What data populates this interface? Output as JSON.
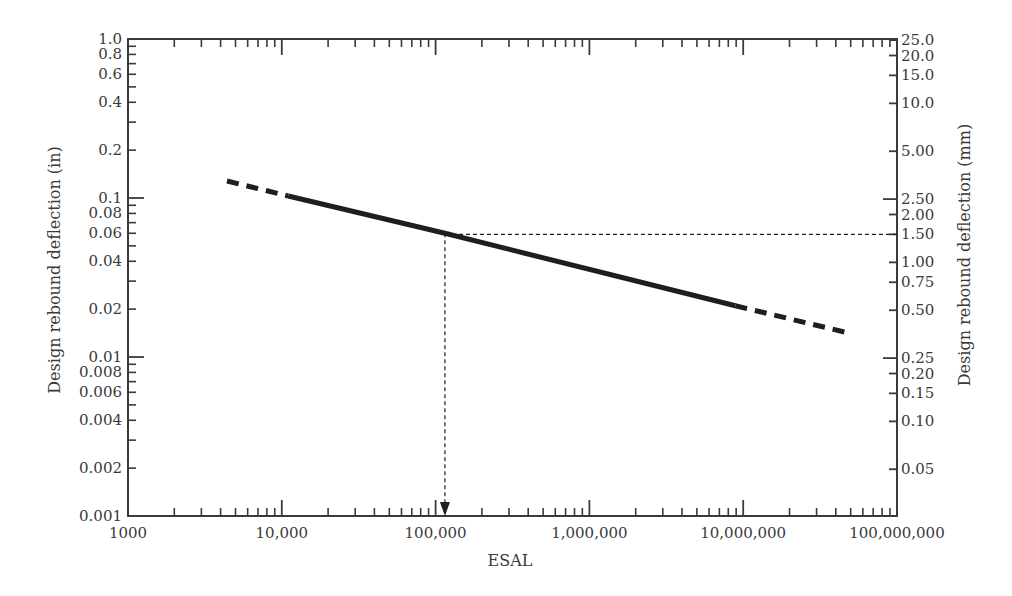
{
  "chart_data": {
    "type": "line",
    "title": "",
    "xlabel": "ESAL",
    "ylabel": "Design rebound deflection (in)",
    "ylabel_right": "Design rebound deflection (mm)",
    "xscale": "log",
    "yscale": "log",
    "xlim": [
      1000,
      100000000
    ],
    "ylim": [
      0.001,
      1.0
    ],
    "grid": false,
    "legend": null,
    "x_ticks": [
      {
        "value": 1000,
        "label": "1000"
      },
      {
        "value": 10000,
        "label": "10,000"
      },
      {
        "value": 100000,
        "label": "100,000"
      },
      {
        "value": 1000000,
        "label": "1,000,000"
      },
      {
        "value": 10000000,
        "label": "10,000,000"
      },
      {
        "value": 100000000,
        "label": "100,000,000"
      }
    ],
    "y_ticks_left": [
      {
        "value": 1.0,
        "label": "1.0"
      },
      {
        "value": 0.8,
        "label": "0.8"
      },
      {
        "value": 0.6,
        "label": "0.6"
      },
      {
        "value": 0.4,
        "label": "0.4"
      },
      {
        "value": 0.2,
        "label": "0.2"
      },
      {
        "value": 0.1,
        "label": "0.1"
      },
      {
        "value": 0.08,
        "label": "0.08"
      },
      {
        "value": 0.06,
        "label": "0.06"
      },
      {
        "value": 0.04,
        "label": "0.04"
      },
      {
        "value": 0.02,
        "label": "0.02"
      },
      {
        "value": 0.01,
        "label": "0.01"
      },
      {
        "value": 0.008,
        "label": "0.008"
      },
      {
        "value": 0.006,
        "label": "0.006"
      },
      {
        "value": 0.004,
        "label": "0.004"
      },
      {
        "value": 0.002,
        "label": "0.002"
      },
      {
        "value": 0.001,
        "label": "0.001"
      }
    ],
    "y_ticks_right": [
      {
        "value_mm": 25.0,
        "label": "25.0"
      },
      {
        "value_mm": 20.0,
        "label": "20.0"
      },
      {
        "value_mm": 15.0,
        "label": "15.0"
      },
      {
        "value_mm": 10.0,
        "label": "10.0"
      },
      {
        "value_mm": 5.0,
        "label": "5.00"
      },
      {
        "value_mm": 2.5,
        "label": "2.50"
      },
      {
        "value_mm": 2.0,
        "label": "2.00"
      },
      {
        "value_mm": 1.5,
        "label": "1.50"
      },
      {
        "value_mm": 1.0,
        "label": "1.00"
      },
      {
        "value_mm": 0.75,
        "label": "0.75"
      },
      {
        "value_mm": 0.5,
        "label": "0.50"
      },
      {
        "value_mm": 0.25,
        "label": "0.25"
      },
      {
        "value_mm": 0.2,
        "label": "0.20"
      },
      {
        "value_mm": 0.15,
        "label": "0.15"
      },
      {
        "value_mm": 0.1,
        "label": "0.10"
      },
      {
        "value_mm": 0.05,
        "label": "0.05"
      }
    ],
    "series": [
      {
        "name": "Design rebound deflection vs ESAL (extrapolated, low)",
        "style": "dashed",
        "x": [
          4400,
          11000
        ],
        "y": [
          0.128,
          0.103
        ]
      },
      {
        "name": "Design rebound deflection vs ESAL",
        "style": "solid",
        "x": [
          11000,
          115000,
          8900000
        ],
        "y": [
          0.103,
          0.06,
          0.021
        ]
      },
      {
        "name": "Design rebound deflection vs ESAL (extrapolated, high)",
        "style": "dashed",
        "x": [
          8900000,
          51000000
        ],
        "y": [
          0.021,
          0.014
        ]
      }
    ],
    "annotations": [
      {
        "type": "guide-line-horizontal",
        "style": "dotted",
        "y": 0.059,
        "y_mm": 1.5,
        "x_from": 115000,
        "x_to": 100000000
      },
      {
        "type": "guide-arrow-vertical",
        "style": "dotted",
        "x": 115000,
        "y_from": 0.06,
        "y_to": 0.001
      }
    ]
  },
  "colors": {
    "axis": "#3a3a3a",
    "line": "#1e1e1e",
    "text": "#3a3a3a",
    "background": "#ffffff"
  }
}
